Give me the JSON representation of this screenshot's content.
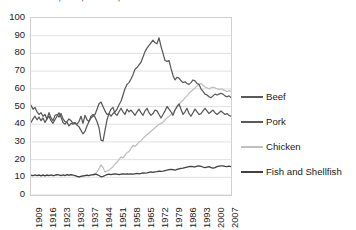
{
  "chart_data": {
    "type": "line",
    "title": "Beef, Pork, Chicken, and Fish and Shellfish",
    "xlabel": "",
    "ylabel": "",
    "ylim": [
      0,
      100
    ],
    "ytick_step": 10,
    "yticks": [
      "100",
      "90",
      "80",
      "70",
      "60",
      "50",
      "40",
      "30",
      "20",
      "10",
      "0"
    ],
    "xlim": [
      1909,
      2009
    ],
    "xticks": [
      "1909",
      "1916",
      "1923",
      "1930",
      "1937",
      "1944",
      "1951",
      "1958",
      "1965",
      "1972",
      "1979",
      "1986",
      "1993",
      "2000",
      "2007"
    ],
    "grid": "horizontal",
    "legend_position": "right",
    "colors": {
      "beef": "#595959",
      "pork": "#595959",
      "chicken": "#bfbfbf",
      "fish": "#404040",
      "gridline": "#d9d9d9",
      "border": "#d0d0d0",
      "text": "#1a1a1a"
    },
    "x_start": 1909,
    "x_step": 1,
    "series": [
      {
        "name": "Beef",
        "key": "beef",
        "color": "#595959",
        "values": [
          50.7,
          48.5,
          49.5,
          47.0,
          45.5,
          46.5,
          44.5,
          45.5,
          43.0,
          46.5,
          43.5,
          42.0,
          45.0,
          45.5,
          44.0,
          46.0,
          43.0,
          41.5,
          41.0,
          39.0,
          40.5,
          40.0,
          40.5,
          40.0,
          41.5,
          44.5,
          40.5,
          45.0,
          42.5,
          41.5,
          43.5,
          44.5,
          45.5,
          48.5,
          51.5,
          52.5,
          50.0,
          47.5,
          45.5,
          46.0,
          44.5,
          46.0,
          47.0,
          48.5,
          51.0,
          53.0,
          56.5,
          60.0,
          62.5,
          63.5,
          65.5,
          68.0,
          71.0,
          72.0,
          73.5,
          75.0,
          78.0,
          81.0,
          83.0,
          84.5,
          86.0,
          87.5,
          86.0,
          85.5,
          88.8,
          84.0,
          80.0,
          76.0,
          75.5,
          76.0,
          71.5,
          67.5,
          65.0,
          66.5,
          66.0,
          64.5,
          63.5,
          64.0,
          63.0,
          62.5,
          63.5,
          65.0,
          64.5,
          63.0,
          62.5,
          60.0,
          58.5,
          57.0,
          56.5,
          55.5,
          55.0,
          56.0,
          57.0,
          56.5,
          57.0,
          57.5,
          57.0,
          56.0,
          55.5,
          56.0,
          55.0
        ]
      },
      {
        "name": "Pork",
        "key": "pork",
        "color": "#595959",
        "values": [
          41.0,
          43.0,
          44.5,
          42.5,
          44.0,
          42.0,
          43.5,
          41.0,
          43.0,
          44.5,
          42.0,
          40.5,
          42.5,
          44.5,
          46.5,
          44.0,
          41.0,
          40.0,
          41.5,
          43.0,
          42.0,
          40.5,
          41.0,
          39.5,
          38.5,
          36.5,
          34.5,
          36.0,
          39.0,
          41.5,
          44.5,
          45.5,
          44.0,
          41.5,
          38.0,
          31.0,
          30.5,
          36.5,
          42.5,
          46.0,
          48.5,
          49.5,
          46.0,
          45.0,
          47.0,
          49.0,
          47.0,
          45.5,
          48.5,
          47.0,
          48.0,
          46.5,
          45.0,
          47.0,
          48.5,
          46.5,
          45.0,
          47.5,
          49.0,
          46.5,
          45.0,
          46.0,
          48.0,
          47.5,
          45.5,
          43.5,
          45.5,
          47.5,
          50.0,
          48.5,
          47.0,
          45.0,
          48.0,
          50.0,
          51.5,
          48.5,
          45.5,
          47.0,
          49.0,
          46.0,
          44.5,
          46.5,
          48.5,
          47.0,
          45.5,
          46.0,
          47.5,
          49.0,
          47.5,
          46.0,
          47.0,
          48.0,
          46.5,
          45.5,
          46.5,
          47.5,
          46.5,
          45.5,
          46.0,
          45.0,
          44.5
        ]
      },
      {
        "name": "Chicken",
        "key": "chicken",
        "color": "#bfbfbf",
        "values": [
          11.0,
          11.0,
          11.5,
          11.0,
          11.5,
          11.0,
          11.5,
          11.0,
          11.5,
          11.0,
          11.5,
          11.0,
          11.0,
          11.5,
          11.5,
          11.0,
          11.5,
          11.0,
          11.5,
          11.0,
          11.5,
          11.0,
          11.0,
          10.5,
          10.0,
          10.5,
          10.5,
          11.0,
          11.0,
          11.0,
          11.5,
          11.0,
          11.5,
          13.0,
          15.0,
          17.0,
          15.5,
          13.0,
          13.5,
          14.0,
          15.0,
          16.0,
          17.5,
          18.5,
          20.0,
          21.5,
          21.0,
          22.5,
          24.0,
          24.5,
          26.5,
          28.0,
          27.5,
          28.5,
          30.0,
          30.5,
          32.0,
          33.0,
          34.0,
          35.0,
          36.0,
          37.0,
          38.0,
          39.0,
          40.0,
          40.5,
          41.0,
          42.5,
          43.5,
          44.5,
          45.5,
          46.5,
          48.0,
          49.5,
          51.0,
          52.5,
          53.5,
          55.0,
          56.0,
          57.5,
          58.5,
          59.5,
          60.5,
          61.5,
          62.5,
          63.0,
          62.0,
          61.0,
          60.5,
          60.0,
          60.5,
          61.0,
          60.5,
          60.0,
          59.5,
          60.0,
          59.5,
          59.0,
          58.5,
          59.0,
          58.5
        ]
      },
      {
        "name": "Fish and Shellfish",
        "key": "fish",
        "color": "#404040",
        "values": [
          11.2,
          11.0,
          11.3,
          11.0,
          11.2,
          10.8,
          11.2,
          10.8,
          11.2,
          11.0,
          11.3,
          11.0,
          11.2,
          11.5,
          11.3,
          11.0,
          11.3,
          11.0,
          11.5,
          11.2,
          11.5,
          11.3,
          11.0,
          10.5,
          10.2,
          10.5,
          10.8,
          11.0,
          11.2,
          11.0,
          11.3,
          11.5,
          11.8,
          11.5,
          11.0,
          10.3,
          10.5,
          11.0,
          11.5,
          11.8,
          11.5,
          11.8,
          12.0,
          11.8,
          11.5,
          11.8,
          12.0,
          11.8,
          12.0,
          11.8,
          12.0,
          11.8,
          12.0,
          12.2,
          12.0,
          12.2,
          12.5,
          12.3,
          12.5,
          12.8,
          13.0,
          12.8,
          13.0,
          13.2,
          13.5,
          13.3,
          13.5,
          13.8,
          14.0,
          14.3,
          14.5,
          14.3,
          14.0,
          14.5,
          14.8,
          15.0,
          15.2,
          15.5,
          15.8,
          16.0,
          16.2,
          16.0,
          15.8,
          16.3,
          16.5,
          16.2,
          15.8,
          15.5,
          15.8,
          16.0,
          15.5,
          15.2,
          15.5,
          16.0,
          16.3,
          16.5,
          16.5,
          16.2,
          16.0,
          16.3,
          16.0
        ]
      }
    ]
  },
  "legend": {
    "items": [
      {
        "label": "Beef",
        "key": "beef"
      },
      {
        "label": "Pork",
        "key": "pork"
      },
      {
        "label": "Chicken",
        "key": "chicken"
      },
      {
        "label": "Fish and Shellfish",
        "key": "fish"
      }
    ]
  }
}
